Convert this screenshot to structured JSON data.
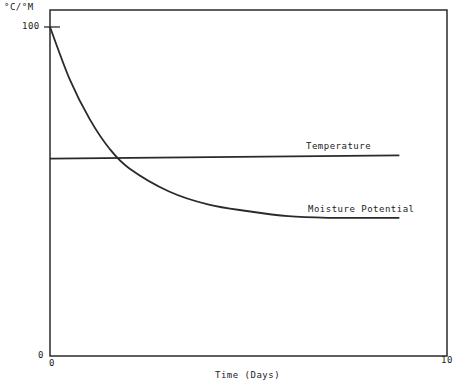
{
  "chart_data": {
    "type": "line",
    "title": "",
    "xlabel": "Time (Days)",
    "ylabel": "°C/°M",
    "xlim": [
      0,
      10
    ],
    "ylim": [
      0,
      100
    ],
    "x_ticks": [
      "0",
      "10"
    ],
    "y_ticks": [
      "0",
      "100"
    ],
    "grid": false,
    "legend": "inline labels",
    "series": [
      {
        "name": "Temperature",
        "x": [
          0,
          8.8
        ],
        "y": [
          60,
          61
        ]
      },
      {
        "name": "Moisture Potential",
        "x": [
          0,
          0.5,
          1,
          1.5,
          2,
          3,
          4,
          5,
          6,
          7,
          8,
          8.8
        ],
        "y": [
          100,
          84,
          72,
          63,
          57,
          50,
          46,
          44,
          42.5,
          42,
          42,
          42
        ]
      }
    ]
  },
  "labels": {
    "y_unit": "°C/°M",
    "y_top": "100",
    "y_bottom": "0",
    "x_left": "0",
    "x_right": "10",
    "x_title": "Time (Days)",
    "temperature": "Temperature",
    "moisture": "Moisture Potential"
  },
  "colors": {
    "line": "#2a2a2a"
  }
}
